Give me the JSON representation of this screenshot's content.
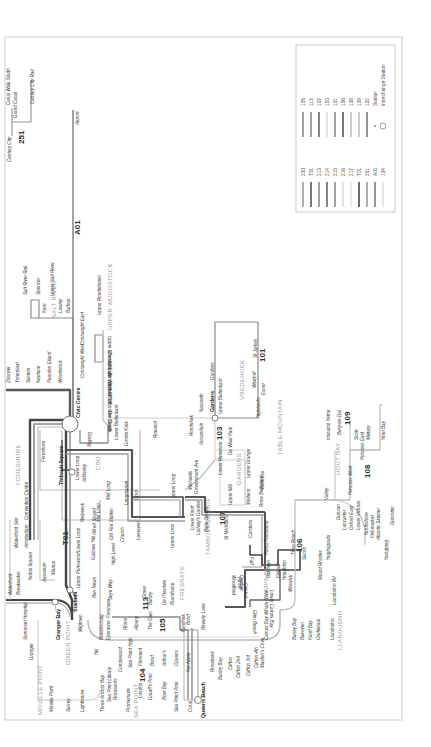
{
  "map": {
    "title": "MyCiTi Route Map",
    "colors": {
      "frame": "#d4d4d4",
      "line_dark": "#555555",
      "line_mid": "#8a8a8a",
      "line_light": "#bdbdbd",
      "line_faint": "#dcdcdc",
      "area_label": "#9a9a9a"
    },
    "legend": {
      "col1": [
        {
          "route": "230",
          "shade": "#9a9a9a"
        },
        {
          "route": "T01",
          "shade": "#555555"
        },
        {
          "route": "213",
          "shade": "#8a8a8a"
        },
        {
          "route": "214",
          "shade": "#666666"
        },
        {
          "route": "215",
          "shade": "#8a8a8a"
        },
        {
          "route": "216",
          "shade": "#dcdcdc"
        },
        {
          "route": "217",
          "shade": "#e6e6e6"
        },
        {
          "route": "T01",
          "shade": "#444444"
        },
        {
          "route": "251",
          "shade": "#9a9a9a"
        },
        {
          "route": "A01",
          "shade": "#7a7a7a"
        },
        {
          "route": "104",
          "shade": "#e0e0e0"
        }
      ],
      "col2": [
        {
          "route": "105",
          "shade": "#8a8a8a"
        },
        {
          "route": "113",
          "shade": "#8a8a8a"
        },
        {
          "route": "107",
          "shade": "#666666"
        },
        {
          "route": "103",
          "shade": "#dcdcdc"
        },
        {
          "route": "101",
          "shade": "#8a8a8a"
        },
        {
          "route": "106",
          "shade": "#555555"
        },
        {
          "route": "108",
          "shade": "#bdbdbd"
        },
        {
          "route": "109",
          "shade": "#bdbdbd"
        },
        {
          "route": "102",
          "shade": "#777777"
        }
      ],
      "station_label": "Station",
      "interchange_label": "Interchange Station"
    },
    "routes_labels": {
      "r251": "251",
      "a01": "A01",
      "t01": "T01",
      "r101": "101",
      "r103": "103",
      "r104": "104",
      "r105": "105",
      "r106": "106",
      "r107": "107",
      "r108": "108",
      "r109": "109",
      "r113": "113"
    },
    "areas": {
      "salt_river": "SALT RIVER",
      "upper_woodstock": "UPPER WOODSTOCK",
      "foreshore": "FORESHORE",
      "cbd": "CBD",
      "vredehoek": "VREDEHOEK",
      "table_mountain": "TABLE MOUNTAIN",
      "gardens": "GARDENS",
      "tamboerskloof": "TAMBOERSKLOOF",
      "fresnaye": "FRESNAYE",
      "camps_bay": "CAMPS BAY",
      "hout_bay": "HOUT BAY",
      "llandudno": "LLANDUDNO",
      "green_point": "GREEN POINT",
      "mouille_point": "MOUILLE POINT",
      "sea_point": "SEA POINT"
    },
    "stations": {
      "century_city": "Century City",
      "grand_canal": "Grand Canal",
      "canal_walk_south": "Canal Walk South",
      "century_city_rail": "Century City Rail",
      "airport": "Airport",
      "salt_river_rail": "Salt River Rail",
      "spencer": "Spencer",
      "kent": "Kent",
      "upper_salt_river": "Upper Salt River",
      "lawley": "Lawley",
      "balfour": "Balfour",
      "upper_roodebloem": "Upper Roodebloem",
      "zoarvlei": "Zoarvlei",
      "paarden_eiland_1": "Ysterplaat",
      "section": "Section",
      "neptune": "Neptune",
      "paarden_eiland": "Paarden Eiland",
      "woodstock": "Woodstock",
      "upper_mountain": "Upper Mountain",
      "chester_east": "Chester East",
      "chester_west": "Chester West",
      "zonnebloem": "Zonnebloem",
      "district_six": "District Six",
      "cput": "CPUT",
      "hanover_street": "Hanover Street",
      "the_castle": "The Castle",
      "connaught_east": "Connaught East",
      "connaught_west": "Connaught West",
      "civic_centre": "Civic Centre",
      "darling": "Darling",
      "lower_buitenkant": "Lower Buitenkant",
      "groote_kerk": "Groote Kerk",
      "roeland": "Roeland",
      "rosedale": "Roodehek",
      "annandale": "Annandale",
      "nazareth": "Nazareth",
      "gardens": "Gardens",
      "gardens_2": "Gardens",
      "upper_buitenkant": "Upper Buitenkant",
      "st_james": "St James",
      "weizhof": "Weizhof",
      "exner": "Exner",
      "vredehoek": "Vrede",
      "highlands": "Highlands",
      "de_waal_park": "De Waal Park",
      "upper_orange": "Upper Orange",
      "montrose": "Montrose",
      "lower_reservoir": "Lower Reservoir",
      "molteno": "Molteno",
      "upper_mill": "Upper Mill",
      "weizegemoed": "Welgemeend",
      "rose_bedstand": "Rose Bedstand",
      "kloof_nek": "Kloof Nek",
      "foreshore": "Foreshore",
      "convention_centre": "Convention Centre",
      "thibault_square": "Thibault Square",
      "lower_long": "Lower Long",
      "adderley": "Adderley",
      "mid_long": "Mid Long",
      "longmarket": "Longmarket",
      "dorp": "Dorp",
      "upper_long": "Upper Long",
      "michaelis": "Michaelis",
      "government_ave": "Government Ave",
      "waterfront_silo": "Waterfront Silo",
      "amsterdam": "Amsterdam",
      "lower_loop": "Lower Loop",
      "riebeeck": "Riebeeck",
      "mid_loop": "Mid Loop",
      "church": "Church",
      "leeuwen": "Leeuwen",
      "upper_loop": "Upper Loop",
      "lower_kloof": "Lower Kloof",
      "ludwigs_garden": "Ludwig's Garden",
      "belle_ombre": "Belle Ombre",
      "st_michaels": "St Michael's",
      "carstens": "Carstens",
      "alfred_strand": "Alfred Strand",
      "old_fire_station": "Old Fire Station",
      "gallows_hill": "Gallows Hill",
      "high_level": "High Level",
      "waterfront": "Waterfront",
      "breakwater": "Breakwater",
      "nobel_square": "Nobel Square",
      "aquarium": "Aquarium",
      "marina": "Marina",
      "stadium": "Stadium",
      "upper_portswood": "Upper Portswood",
      "granger_bay": "Granger Bay",
      "somerset_hospital": "Somerset Hospital",
      "granger": "Granger",
      "wigtown": "Wigtown",
      "ravenscraig": "Ravenscraig",
      "ebenezer": "Ebenezer",
      "hill": "Hill",
      "ben_nevis": "Ben Nevis",
      "skye_way": "Skye Way",
      "fresnaye_st": "Fresnaye",
      "dover": "Dover",
      "bantry": "Bantry",
      "de_lorentz": "De l'Hermite",
      "brandsane": "Brandsane",
      "upper_kloof": "Upper Kloof",
      "rhine": "Rhine",
      "albany": "Albany",
      "the_glen": "The Glen",
      "kloofnek_rd": "Kloofnek",
      "top_bond": "Bond",
      "beverly_lane": "Beverly Lane",
      "queens_beach": "Queens Beach",
      "mouille_point": "Mouille Point",
      "surrey": "Surrey",
      "lighthouse": "Lighthouse",
      "three_anchor_bay": "Three Anchor Bay",
      "sea_point_library": "Sea Point Library",
      "rocklands": "Rocklands",
      "promenade": "Promenade",
      "london": "London",
      "graaff_pool": "Graaff's Pool",
      "boat_bay": "Boat Bay",
      "sea_point_pool": "Sea Point Pool",
      "coral": "Coral",
      "cumberland": "Cumberland",
      "sea_point_high": "Sea Point High",
      "firmount": "Firmount",
      "arthurs": "Arthur's",
      "clarens": "Clarens",
      "ext_apple": "Kei Apple",
      "rosebank": "Rosebank",
      "bantry_bay": "Bantry Bay",
      "clifton": "Clifton",
      "clifton_2nd": "Clifton 2nd",
      "clifton_3rd": "Clifton 3rd",
      "clifton_4th": "Clifton 4th",
      "maidens_cove": "Maiden's Cove",
      "glen_beach": "Glen Beach",
      "camps_bay_whale_rock": "Camps Bay Whale Rock",
      "lower_camps_bay": "Lower Camps Bay",
      "quebec": "Quebec",
      "woodford": "Woodford",
      "altred": "Atholl",
      "central": "Central",
      "fall": "Fall",
      "berwick_hall": "Berwick",
      "fiskaal": "Fiskaal",
      "houghton": "Houghton",
      "bakoven": "Bakoven",
      "prima_sunsets": "Prima Panorama",
      "wanna": "Warwick",
      "theo_reach": "Theo Roach",
      "saxon": "Saxon",
      "barley_bay": "Barley Bay",
      "bakoven_2": "Bakoven",
      "koeel_bay": "Kloof Bay",
      "oudekraal": "Oudekraal",
      "llandudno": "Llandudno",
      "valley": "Valley",
      "hughsgrade": "Hughsgrade",
      "mount_rhodes": "Mount Rhodes",
      "pacificoordes": "Llandudno Rd",
      "dunlaps": "Duncan",
      "victorias": "Victoria",
      "lancaster": "Lancaster",
      "oxford_east": "Oxford East",
      "lower_victoria": "Lower Victoria",
      "northshore": "Northshore",
      "rotunda": "Fishmarket",
      "atlantic_skipper": "Atlantic Skipper",
      "hangberg": "Hangberg",
      "princess_west": "Princess West",
      "princess_east": "Princess East",
      "imizamo_yethu": "Imizamo Yethu",
      "baru_en_dal": "Berg-en-Dal",
      "scott": "Scott",
      "military": "Military",
      "hout_bay": "Hout Bay",
      "dunrobin": "Dunrobin"
    }
  }
}
